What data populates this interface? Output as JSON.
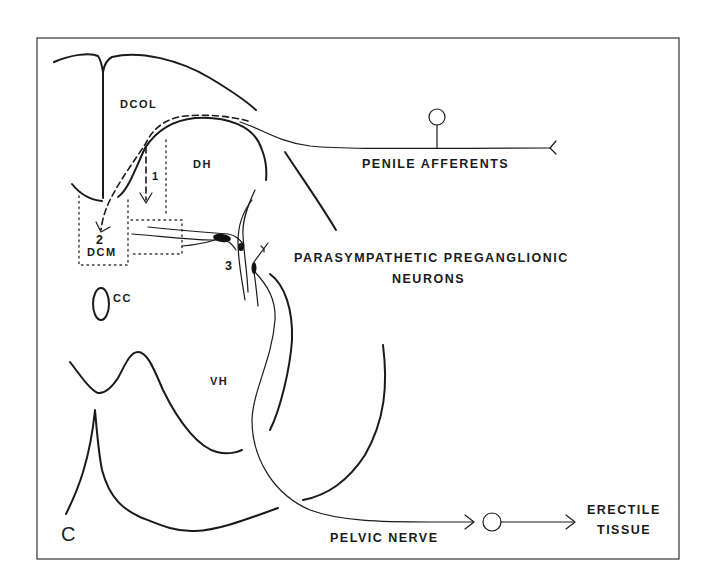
{
  "figure": {
    "panel_label": "C",
    "regions": {
      "dcol": "DCOL",
      "dh": "DH",
      "dcm": "DCM",
      "cc": "CC",
      "vh": "VH"
    },
    "markers": {
      "m1": "1",
      "m2": "2",
      "m3": "3"
    },
    "labels": {
      "penile_afferents": "PENILE AFFERENTS",
      "ppn_line1": "PARASYMPATHETIC PREGANGLIONIC",
      "ppn_line2": "NEURONS",
      "pelvic_nerve": "PELVIC NERVE",
      "erectile_line1": "ERECTILE",
      "erectile_line2": "TISSUE"
    }
  }
}
